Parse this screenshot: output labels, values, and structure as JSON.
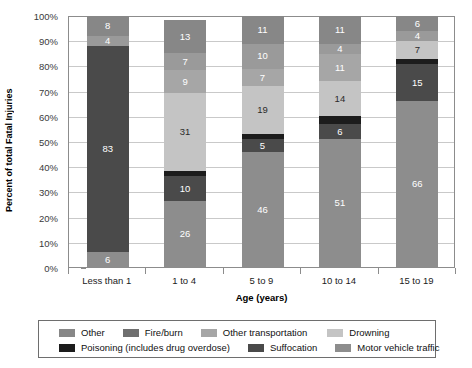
{
  "chart_data": {
    "type": "bar",
    "subtype": "stacked-bar-percent",
    "title": "",
    "xlabel": "Age (years)",
    "ylabel": "Percent of total Fatal Injuries",
    "categories": [
      "Less than 1",
      "1 to 4",
      "5 to 9",
      "10 to 14",
      "15 to 19"
    ],
    "ylim": [
      0,
      100
    ],
    "ytick_labels": [
      "0%",
      "10%",
      "20%",
      "30%",
      "40%",
      "50%",
      "60%",
      "70%",
      "80%",
      "90%",
      "100%"
    ],
    "ytick_values": [
      0,
      10,
      20,
      30,
      40,
      50,
      60,
      70,
      80,
      90,
      100
    ],
    "grid": true,
    "legend_position": "bottom",
    "stack_order_bottom_to_top": [
      "Motor vehicle traffic",
      "Suffocation",
      "Poisoning (includes drug overdose)",
      "Drowning",
      "Other transportation",
      "Fire/burn",
      "Other"
    ],
    "series": [
      {
        "name": "Motor vehicle traffic",
        "color": "#8d8d8d",
        "label_color": "#ffffff",
        "values": [
          6,
          26,
          46,
          51,
          66
        ],
        "labels": [
          "6",
          "26",
          "46",
          "51",
          "66"
        ]
      },
      {
        "name": "Suffocation",
        "color": "#4a4a4a",
        "label_color": "#ffffff",
        "values": [
          83,
          10,
          5,
          6,
          15
        ],
        "labels": [
          "83",
          "10",
          "5",
          "6",
          "15"
        ]
      },
      {
        "name": "Poisoning (includes drug overdose)",
        "color": "#1c1c1c",
        "label_color": "#ffffff",
        "values": [
          0,
          2,
          2,
          3,
          2
        ],
        "labels": [
          "",
          "",
          "",
          "",
          ""
        ]
      },
      {
        "name": "Drowning",
        "color": "#c4c4c4",
        "label_color": "#2b2b2b",
        "values": [
          0,
          31,
          19,
          14,
          7
        ],
        "labels": [
          "",
          "31",
          "19",
          "14",
          "7"
        ]
      },
      {
        "name": "Other transportation",
        "color": "#a6a6a6",
        "label_color": "#ffffff",
        "values": [
          0,
          9,
          7,
          11,
          0
        ],
        "labels": [
          "",
          "9",
          "7",
          "11",
          ""
        ]
      },
      {
        "name": "Fire/burn",
        "color": "#9a9a9a",
        "label_color": "#ffffff",
        "values": [
          4,
          7,
          10,
          4,
          4
        ],
        "labels": [
          "4",
          "7",
          "10",
          "4",
          "4"
        ]
      },
      {
        "name": "Other",
        "color": "#878787",
        "label_color": "#ffffff",
        "values": [
          8,
          13,
          11,
          11,
          6
        ],
        "labels": [
          "8",
          "13",
          "11",
          "11",
          "6"
        ]
      }
    ]
  },
  "legend": {
    "row1": [
      {
        "label": "Other",
        "color": "#878787"
      },
      {
        "label": "Fire/burn",
        "color": "#6f6f6f"
      },
      {
        "label": "Other transportation",
        "color": "#a6a6a6"
      },
      {
        "label": "Drowning",
        "color": "#c4c4c4"
      }
    ],
    "row2": [
      {
        "label": "Poisoning (includes drug overdose)",
        "color": "#1c1c1c"
      },
      {
        "label": "Suffocation",
        "color": "#4a4a4a"
      },
      {
        "label": "Motor vehicle traffic",
        "color": "#8d8d8d"
      }
    ]
  }
}
